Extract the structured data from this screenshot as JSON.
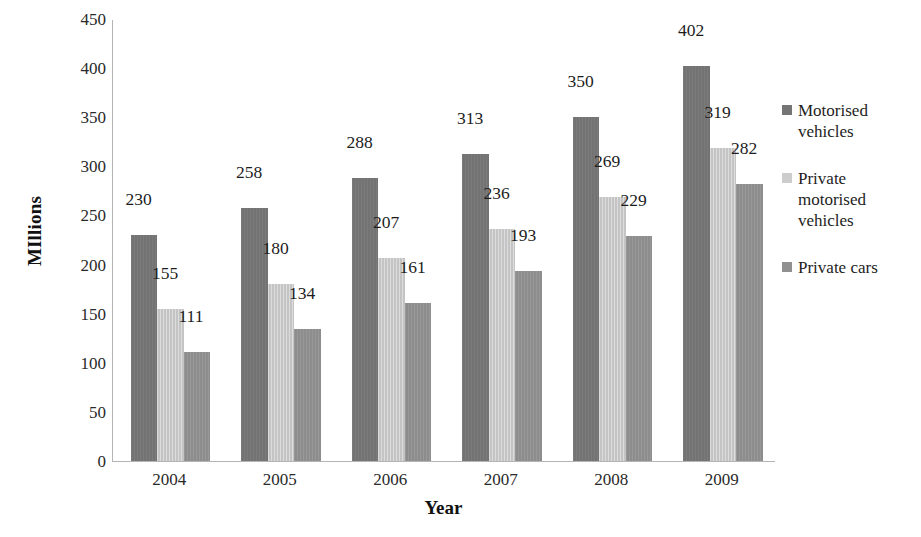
{
  "chart_data": {
    "type": "bar",
    "title": "",
    "subtitle": "",
    "xlabel": "Year",
    "ylabel": "MIllions",
    "categories": [
      "2004",
      "2005",
      "2006",
      "2007",
      "2008",
      "2009"
    ],
    "series": [
      {
        "name": "Motorised vehicles",
        "color": "#757575",
        "values": [
          230,
          258,
          288,
          313,
          350,
          402
        ]
      },
      {
        "name": "Private motorised vehicles",
        "color": "#cdcdcd",
        "values": [
          155,
          180,
          207,
          236,
          269,
          319
        ]
      },
      {
        "name": "Private cars",
        "color": "#909090",
        "values": [
          111,
          134,
          161,
          193,
          229,
          282
        ]
      }
    ],
    "ylim": [
      0,
      450
    ],
    "y_ticks": [
      450,
      400,
      350,
      300,
      250,
      200,
      150,
      100,
      50,
      0
    ],
    "grid": false,
    "data_labels": true,
    "legend_position": "right",
    "background_color": "#ffffff"
  }
}
